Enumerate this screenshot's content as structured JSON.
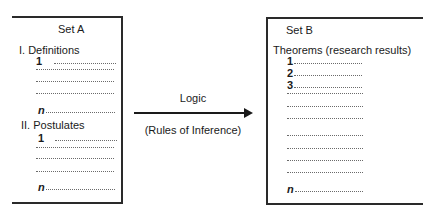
{
  "diagram": {
    "set_a": {
      "title": "Set A",
      "sections": [
        {
          "heading": "I. Definitions",
          "items": [
            "1",
            "",
            "",
            "",
            "n"
          ]
        },
        {
          "heading": "II. Postulates",
          "items": [
            "1",
            "",
            "",
            "",
            "n"
          ]
        }
      ]
    },
    "arrow": {
      "label_top": "Logic",
      "label_bottom": "(Rules of Inference)",
      "direction": "right"
    },
    "set_b": {
      "title": "Set B",
      "heading": "Theorems (research results)",
      "items": [
        "1",
        "2",
        "3",
        "",
        "",
        "",
        "",
        "",
        "",
        "",
        "n"
      ]
    },
    "colors": {
      "line": "#2a2a2a",
      "text": "#1a1a1a",
      "dots": "#6a6a6a",
      "background": "#ffffff"
    }
  }
}
